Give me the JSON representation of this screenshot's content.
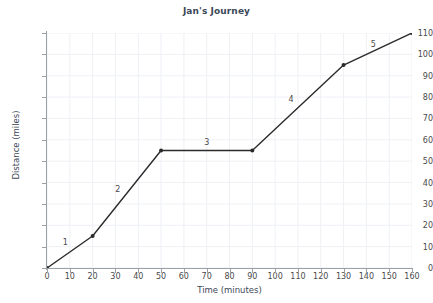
{
  "chart_data": {
    "type": "line",
    "title": "Jan's Journey",
    "xlabel": "Time (minutes)",
    "ylabel": "Distance (miles)",
    "xlim": [
      0,
      160
    ],
    "ylim": [
      0,
      110
    ],
    "grid": true,
    "legend": "none",
    "x": [
      0,
      20,
      50,
      90,
      130,
      160
    ],
    "values": [
      0,
      15,
      55,
      55,
      95,
      110
    ],
    "points": [
      {
        "x": 0,
        "y": 0
      },
      {
        "x": 20,
        "y": 15
      },
      {
        "x": 50,
        "y": 55
      },
      {
        "x": 90,
        "y": 55
      },
      {
        "x": 130,
        "y": 95
      },
      {
        "x": 160,
        "y": 110
      }
    ],
    "xticks": [
      0,
      10,
      20,
      30,
      40,
      50,
      60,
      70,
      80,
      90,
      100,
      110,
      120,
      130,
      140,
      150,
      160
    ],
    "xtick_labels": [
      "0",
      "10",
      "20",
      "30",
      "40",
      "50",
      "60",
      "70",
      "80",
      "90",
      "100",
      "110",
      "120",
      "130",
      "140",
      "150",
      "160"
    ],
    "yticks": [
      0,
      10,
      20,
      30,
      40,
      50,
      60,
      70,
      80,
      90,
      100,
      110
    ],
    "ytick_labels": [
      "0",
      "10",
      "20",
      "30",
      "40",
      "50",
      "60",
      "70",
      "80",
      "90",
      "100",
      "110"
    ],
    "annotations": [
      {
        "text": "1",
        "x": 8,
        "y": 12
      },
      {
        "text": "2",
        "x": 31,
        "y": 37
      },
      {
        "text": "3",
        "x": 70,
        "y": 59
      },
      {
        "text": "4",
        "x": 107,
        "y": 79
      },
      {
        "text": "5",
        "x": 143,
        "y": 105
      }
    ],
    "series_color": "#2b2b2b",
    "grid_color": "#eef0f4",
    "axis_color": "#9aa0a6",
    "text_color": "#3c4858"
  }
}
